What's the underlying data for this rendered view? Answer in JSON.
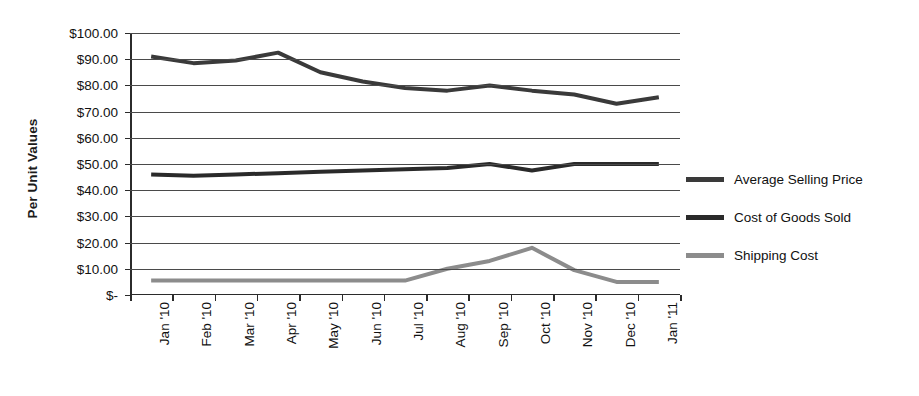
{
  "chart_data": {
    "type": "line",
    "title": "",
    "xlabel": "",
    "ylabel": "Per Unit Values",
    "ylim": [
      0,
      100
    ],
    "ytick_step": 10,
    "grid": true,
    "legend_position": "right",
    "categories": [
      "Jan '10",
      "Feb '10",
      "Mar '10",
      "Apr '10",
      "May '10",
      "Jun '10",
      "Jul '10",
      "Aug '10",
      "Sep '10",
      "Oct '10",
      "Nov '10",
      "Dec '10",
      "Jan '11"
    ],
    "ytick_labels": [
      "$100.00",
      "$90.00",
      "$80.00",
      "$70.00",
      "$60.00",
      "$50.00",
      "$40.00",
      "$30.00",
      "$20.00",
      "$10.00",
      "$-"
    ],
    "ytick_values": [
      100,
      90,
      80,
      70,
      60,
      50,
      40,
      30,
      20,
      10,
      0
    ],
    "series": [
      {
        "name": "Average Selling Price",
        "color": "#3a3a3a",
        "values": [
          91.0,
          88.5,
          89.5,
          92.5,
          85.0,
          81.5,
          79.0,
          78.0,
          80.0,
          78.0,
          76.5,
          73.0,
          75.5
        ]
      },
      {
        "name": "Cost of Goods Sold",
        "color": "#2a2a2a",
        "values": [
          46.0,
          45.5,
          46.0,
          46.5,
          47.0,
          47.5,
          48.0,
          48.5,
          50.0,
          47.5,
          50.0,
          50.0,
          50.0
        ]
      },
      {
        "name": "Shipping Cost",
        "color": "#8c8c8c",
        "values": [
          5.5,
          5.5,
          5.5,
          5.5,
          5.5,
          5.5,
          5.5,
          10.0,
          13.0,
          18.0,
          9.5,
          5.0,
          5.0
        ]
      }
    ]
  }
}
